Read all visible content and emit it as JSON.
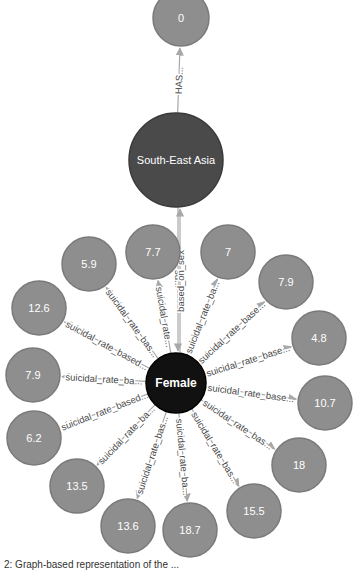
{
  "colors": {
    "value_node_fill": "#8e8e8e",
    "value_node_stroke": "#7a7a7a",
    "region_node_fill": "#4a4a4a",
    "region_node_stroke": "#3a3a3a",
    "sex_node_fill": "#111111",
    "sex_node_stroke": "#000000",
    "edge": "#a8a8a8",
    "edge_label": "#4a4a4a"
  },
  "nodes": [
    {
      "id": "n0",
      "label": "0",
      "type": "value",
      "x": 181,
      "y": 18,
      "r": 28
    },
    {
      "id": "sea",
      "label": "South-East Asia",
      "type": "region",
      "x": 176,
      "y": 160,
      "r": 47
    },
    {
      "id": "female",
      "label": "Female",
      "type": "sex",
      "x": 176,
      "y": 383,
      "r": 30
    },
    {
      "id": "v77",
      "label": "7.7",
      "type": "value",
      "x": 153,
      "y": 252,
      "r": 27
    },
    {
      "id": "v7",
      "label": "7",
      "type": "value",
      "x": 228,
      "y": 252,
      "r": 27
    },
    {
      "id": "v59",
      "label": "5.9",
      "type": "value",
      "x": 89,
      "y": 264,
      "r": 27
    },
    {
      "id": "v79a",
      "label": "7.9",
      "type": "value",
      "x": 286,
      "y": 282,
      "r": 27
    },
    {
      "id": "v126",
      "label": "12.6",
      "type": "value",
      "x": 39,
      "y": 308,
      "r": 27
    },
    {
      "id": "v48",
      "label": "4.8",
      "type": "value",
      "x": 319,
      "y": 338,
      "r": 27
    },
    {
      "id": "v79b",
      "label": "7.9",
      "type": "value",
      "x": 33,
      "y": 375,
      "r": 27
    },
    {
      "id": "v107",
      "label": "10.7",
      "type": "value",
      "x": 325,
      "y": 403,
      "r": 27
    },
    {
      "id": "v62",
      "label": "6.2",
      "type": "value",
      "x": 34,
      "y": 438,
      "r": 27
    },
    {
      "id": "v18",
      "label": "18",
      "type": "value",
      "x": 299,
      "y": 465,
      "r": 27
    },
    {
      "id": "v135",
      "label": "13.5",
      "type": "value",
      "x": 77,
      "y": 486,
      "r": 27
    },
    {
      "id": "v155",
      "label": "15.5",
      "type": "value",
      "x": 254,
      "y": 511,
      "r": 27
    },
    {
      "id": "v136",
      "label": "13.6",
      "type": "value",
      "x": 128,
      "y": 526,
      "r": 27
    },
    {
      "id": "v187",
      "label": "18.7",
      "type": "value",
      "x": 190,
      "y": 530,
      "r": 27
    }
  ],
  "edges": [
    {
      "from": "sea",
      "to": "n0",
      "label": "HAS..."
    },
    {
      "from": "sea",
      "to": "female",
      "label": "su..."
    },
    {
      "from": "female",
      "to": "sea",
      "label": "based_on_sex",
      "parallel": true
    },
    {
      "from": "female",
      "to": "v77",
      "label": "suicidal_rate..."
    },
    {
      "from": "female",
      "to": "v7",
      "label": "suicidal_rate_ba..."
    },
    {
      "from": "female",
      "to": "v59",
      "label": "suicidal_rate_bas..."
    },
    {
      "from": "female",
      "to": "v79a",
      "label": "suicidal_rate_base..."
    },
    {
      "from": "female",
      "to": "v126",
      "label": "suicidal_rate_based..."
    },
    {
      "from": "female",
      "to": "v48",
      "label": "suicidal_rate_base..."
    },
    {
      "from": "female",
      "to": "v79b",
      "label": "suicidal_rate_ba..."
    },
    {
      "from": "female",
      "to": "v107",
      "label": "suicidal_rate_base..."
    },
    {
      "from": "female",
      "to": "v62",
      "label": "suicidal_rate_based..."
    },
    {
      "from": "female",
      "to": "v18",
      "label": "suicidal_rate_bas..."
    },
    {
      "from": "female",
      "to": "v135",
      "label": "suicidal_rate_ba..."
    },
    {
      "from": "female",
      "to": "v155",
      "label": "suicidal_rate_bas..."
    },
    {
      "from": "female",
      "to": "v136",
      "label": "suicidal_rate_bas..."
    },
    {
      "from": "female",
      "to": "v187",
      "label": "suicidal_rate_ba..."
    }
  ],
  "caption": "2: Graph-based representation of the ..."
}
